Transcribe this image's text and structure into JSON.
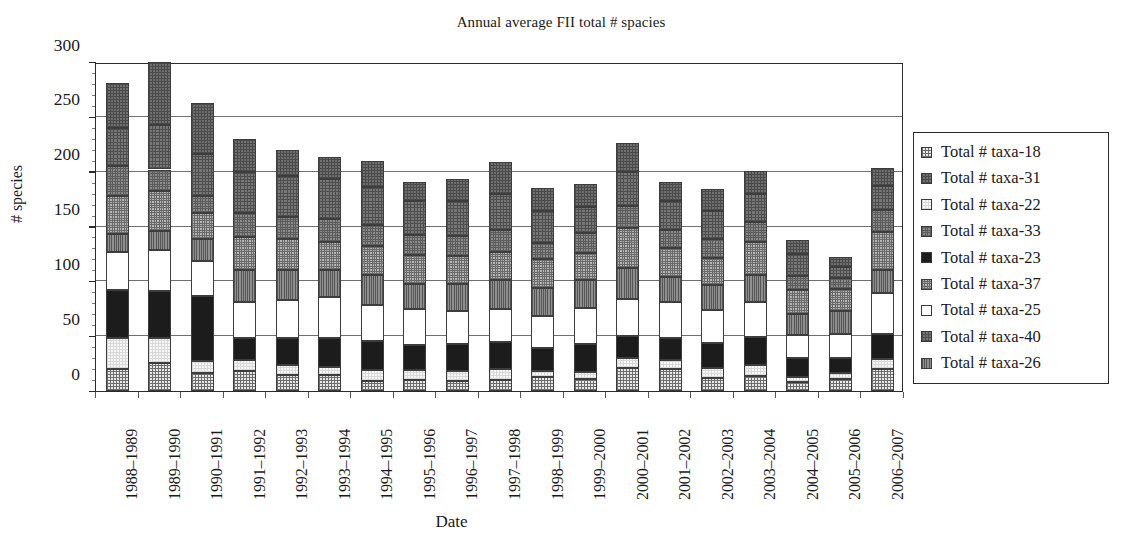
{
  "chart_data": {
    "type": "bar",
    "subtype": "stacked-vertical",
    "title": "Annual average FII total # spacies",
    "xlabel": "Date",
    "ylabel": "# species",
    "ylim": [
      0,
      300
    ],
    "ytick_labels": [
      "0",
      "50",
      "100",
      "150",
      "200",
      "250",
      "300"
    ],
    "ytick_values": [
      0,
      50,
      100,
      150,
      200,
      250,
      300
    ],
    "grid": "horizontal",
    "legend_position": "right",
    "categories": [
      "1988–1989",
      "1989–1990",
      "1990–1991",
      "1991–1992",
      "1992–1993",
      "1993–1994",
      "1994–1995",
      "1995–1996",
      "1996–1997",
      "1997–1998",
      "1998–1999",
      "1999–2000",
      "2000–2001",
      "2001–2002",
      "2002–2003",
      "2003–2004",
      "2004–2005",
      "2005–2006",
      "2006–2007"
    ],
    "stack_order_bottom_to_top": [
      "taxa-18",
      "taxa-22",
      "taxa-23",
      "taxa-25",
      "taxa-26",
      "taxa-37",
      "taxa-33",
      "taxa-40",
      "taxa-31"
    ],
    "series": [
      {
        "name": "Total # taxa-18",
        "key": "taxa-18",
        "pattern": "fine-grid-light",
        "values": [
          20,
          26,
          16,
          18,
          15,
          15,
          9,
          10,
          9,
          10,
          13,
          11,
          21,
          20,
          12,
          14,
          8,
          11,
          20
        ]
      },
      {
        "name": "Total # taxa-22",
        "key": "taxa-22",
        "pattern": "very-light-grid",
        "values": [
          28,
          22,
          11,
          10,
          9,
          7,
          10,
          9,
          9,
          10,
          5,
          6,
          9,
          8,
          9,
          10,
          5,
          5,
          9
        ]
      },
      {
        "name": "Total # taxa-23",
        "key": "taxa-23",
        "pattern": "solid-black",
        "values": [
          44,
          43,
          60,
          20,
          24,
          26,
          27,
          23,
          25,
          25,
          21,
          26,
          20,
          20,
          23,
          25,
          17,
          14,
          23
        ]
      },
      {
        "name": "Total # taxa-25",
        "key": "taxa-25",
        "pattern": "solid-white",
        "values": [
          35,
          38,
          32,
          33,
          35,
          38,
          32,
          33,
          30,
          30,
          29,
          33,
          34,
          33,
          30,
          32,
          21,
          22,
          37
        ]
      },
      {
        "name": "Total # taxa-26",
        "key": "taxa-26",
        "pattern": "vertical-lines",
        "values": [
          16,
          17,
          20,
          29,
          27,
          24,
          28,
          23,
          25,
          26,
          26,
          25,
          28,
          23,
          23,
          25,
          19,
          21,
          21
        ]
      },
      {
        "name": "Total # taxa-37",
        "key": "taxa-37",
        "pattern": "medium-grid",
        "values": [
          35,
          36,
          23,
          30,
          29,
          26,
          26,
          26,
          25,
          26,
          26,
          25,
          37,
          26,
          24,
          30,
          22,
          20,
          35
        ]
      },
      {
        "name": "Total # taxa-33",
        "key": "taxa-33",
        "pattern": "dense-grid",
        "values": [
          27,
          20,
          16,
          22,
          20,
          21,
          19,
          18,
          18,
          20,
          15,
          18,
          20,
          17,
          18,
          18,
          13,
          10,
          20
        ]
      },
      {
        "name": "Total # taxa-40",
        "key": "taxa-40",
        "pattern": "coarse-grid",
        "values": [
          35,
          41,
          38,
          38,
          37,
          36,
          35,
          31,
          32,
          33,
          29,
          24,
          31,
          26,
          25,
          26,
          20,
          10,
          22
        ]
      },
      {
        "name": "Total # taxa-31",
        "key": "taxa-31",
        "pattern": "dark-grid",
        "values": [
          41,
          57,
          47,
          30,
          24,
          20,
          24,
          18,
          20,
          29,
          21,
          21,
          26,
          18,
          20,
          21,
          13,
          9,
          16
        ]
      }
    ],
    "totals": [
      281,
      300,
      263,
      230,
      220,
      213,
      210,
      191,
      193,
      209,
      185,
      189,
      226,
      191,
      184,
      201,
      138,
      122,
      203
    ]
  },
  "legend": {
    "items": [
      {
        "label": "Total # taxa-18",
        "key": "taxa-18"
      },
      {
        "label": "Total # taxa-31",
        "key": "taxa-31"
      },
      {
        "label": "Total # taxa-22",
        "key": "taxa-22"
      },
      {
        "label": "Total # taxa-33",
        "key": "taxa-33"
      },
      {
        "label": "Total # taxa-23",
        "key": "taxa-23"
      },
      {
        "label": "Total # taxa-37",
        "key": "taxa-37"
      },
      {
        "label": "Total # taxa-25",
        "key": "taxa-25"
      },
      {
        "label": "Total # taxa-40",
        "key": "taxa-40"
      },
      {
        "label": "Total # taxa-26",
        "key": "taxa-26"
      }
    ]
  },
  "colors": {
    "axis": "#2b2b2b",
    "gridline": "#6f6f6f",
    "text": "#1a1a1a",
    "background": "#ffffff"
  }
}
